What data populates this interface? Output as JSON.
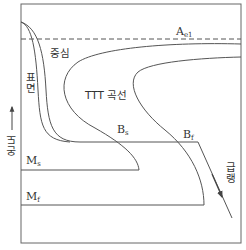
{
  "diagram": {
    "type": "TTT cooling diagram",
    "labels": {
      "ae1": {
        "main": "A",
        "sub": "e1"
      },
      "center": "중심",
      "surface": "표면",
      "ttt_curve": "TTT 곡선",
      "bs": {
        "main": "B",
        "sub": "s"
      },
      "bf": {
        "main": "B",
        "sub": "f"
      },
      "ms": {
        "main": "M",
        "sub": "s"
      },
      "mf": {
        "main": "M",
        "sub": "f"
      },
      "temperature_axis": "온도",
      "quench": "급랭"
    },
    "colors": {
      "line": "#555555",
      "text": "#333333",
      "background": "#ffffff"
    }
  }
}
